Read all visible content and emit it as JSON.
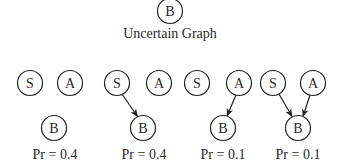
{
  "title": "Uncertain Graph",
  "colors": {
    "stroke": "#222222",
    "text": "#2a2a2a",
    "background": "#ffffff"
  },
  "uncertain_graph": {
    "nodes": [
      {
        "id": "B",
        "label": "B"
      }
    ]
  },
  "possible_worlds": [
    {
      "nodes": [
        {
          "id": "S",
          "label": "S"
        },
        {
          "id": "A",
          "label": "A"
        },
        {
          "id": "B",
          "label": "B"
        }
      ],
      "edges": [],
      "probability_label": "Pr = 0.4"
    },
    {
      "nodes": [
        {
          "id": "S",
          "label": "S"
        },
        {
          "id": "A",
          "label": "A"
        },
        {
          "id": "B",
          "label": "B"
        }
      ],
      "edges": [
        {
          "from": "S",
          "to": "B"
        }
      ],
      "probability_label": "Pr = 0.4"
    },
    {
      "nodes": [
        {
          "id": "S",
          "label": "S"
        },
        {
          "id": "A",
          "label": "A"
        },
        {
          "id": "B",
          "label": "B"
        }
      ],
      "edges": [
        {
          "from": "A",
          "to": "B"
        }
      ],
      "probability_label": "Pr = 0.1"
    },
    {
      "nodes": [
        {
          "id": "S",
          "label": "S"
        },
        {
          "id": "A",
          "label": "A"
        },
        {
          "id": "B",
          "label": "B"
        }
      ],
      "edges": [
        {
          "from": "S",
          "to": "B"
        },
        {
          "from": "A",
          "to": "B"
        }
      ],
      "probability_label": "Pr = 0.1"
    }
  ]
}
